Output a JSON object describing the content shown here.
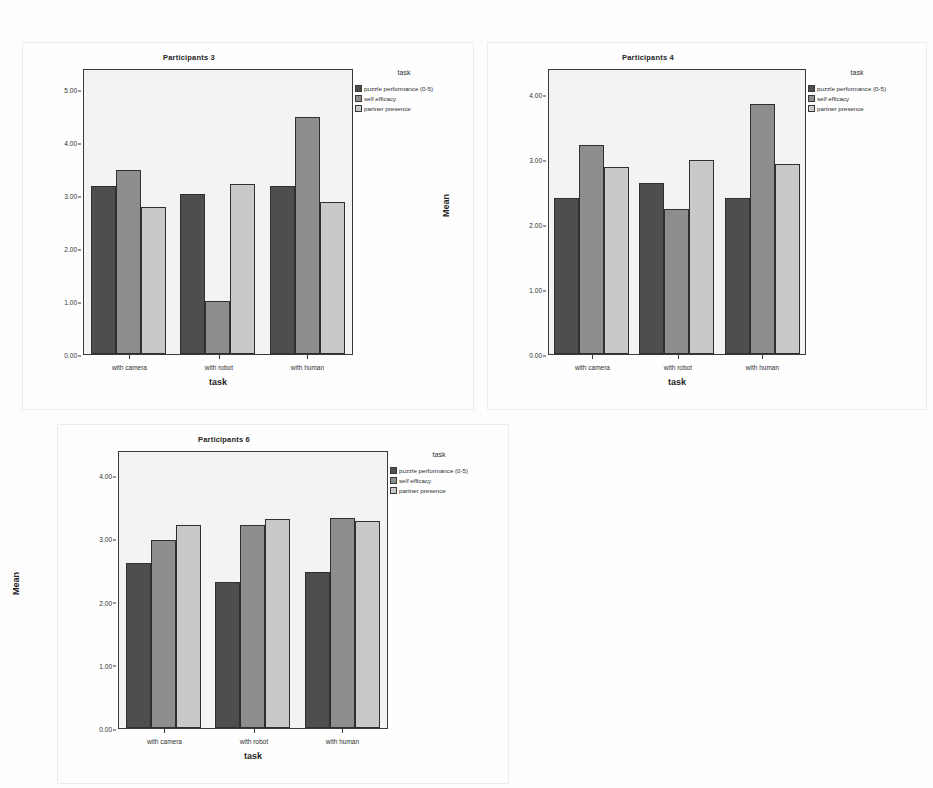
{
  "figure": {
    "background_color": "#fdfdfd",
    "plot_background_color": "#f3f3f3",
    "series_colors": [
      "#4e4e4e",
      "#8d8d8d",
      "#c9c9c9"
    ],
    "legend_title": "task",
    "axis_x_label": "task",
    "axis_y_label": "Mean"
  },
  "chart_data": [
    {
      "type": "bar",
      "title": "Participants 3",
      "xlabel": "task",
      "ylabel": "Mean",
      "categories": [
        "with camera",
        "with robot",
        "with human"
      ],
      "series": [
        {
          "name": "puzzle performance (0-5)",
          "color": "#4e4e4e",
          "values": [
            3.2,
            3.05,
            3.19
          ]
        },
        {
          "name": "self efficacy",
          "color": "#8d8d8d",
          "values": [
            3.5,
            1.0,
            4.5
          ]
        },
        {
          "name": "partner presence",
          "color": "#c9c9c9",
          "values": [
            2.79,
            3.24,
            2.89
          ]
        }
      ],
      "ylim": [
        0,
        5.4
      ],
      "yticks": [
        "5.00",
        "4.00",
        "3.00",
        "2.00",
        "1.00",
        "0.00"
      ],
      "ytick_values": [
        5.0,
        4.0,
        3.0,
        2.0,
        1.0,
        0.0
      ],
      "grid": false,
      "legend_position": "right",
      "legend_title": "task"
    },
    {
      "type": "bar",
      "title": "Participants 4",
      "xlabel": "task",
      "ylabel": "Mean",
      "categories": [
        "with camera",
        "with robot",
        "with human"
      ],
      "series": [
        {
          "name": "puzzle performance (0-5)",
          "color": "#4e4e4e",
          "values": [
            2.41,
            2.65,
            2.41
          ]
        },
        {
          "name": "self efficacy",
          "color": "#8d8d8d",
          "values": [
            3.24,
            2.24,
            3.87
          ]
        },
        {
          "name": "partner presence",
          "color": "#c9c9c9",
          "values": [
            2.89,
            3.0,
            2.95
          ]
        }
      ],
      "ylim": [
        0,
        4.4
      ],
      "yticks": [
        "4.00",
        "3.00",
        "2.00",
        "1.00",
        "0.00"
      ],
      "ytick_values": [
        4.0,
        3.0,
        2.0,
        1.0,
        0.0
      ],
      "grid": false,
      "legend_position": "right",
      "legend_title": "task"
    },
    {
      "type": "bar",
      "title": "Participants 6",
      "xlabel": "task",
      "ylabel": "Mean",
      "categories": [
        "with camera",
        "with robot",
        "with human"
      ],
      "series": [
        {
          "name": "puzzle performance (0-5)",
          "color": "#4e4e4e",
          "values": [
            2.63,
            2.33,
            2.48
          ]
        },
        {
          "name": "self efficacy",
          "color": "#8d8d8d",
          "values": [
            2.99,
            3.23,
            3.35
          ]
        },
        {
          "name": "partner presence",
          "color": "#c9c9c9",
          "values": [
            3.23,
            3.34,
            3.3
          ]
        }
      ],
      "ylim": [
        0,
        4.4
      ],
      "yticks": [
        "4.00",
        "3.00",
        "2.00",
        "1.00",
        "0.00"
      ],
      "ytick_values": [
        4.0,
        3.0,
        2.0,
        1.0,
        0.0
      ],
      "grid": false,
      "legend_position": "right",
      "legend_title": "task"
    }
  ]
}
